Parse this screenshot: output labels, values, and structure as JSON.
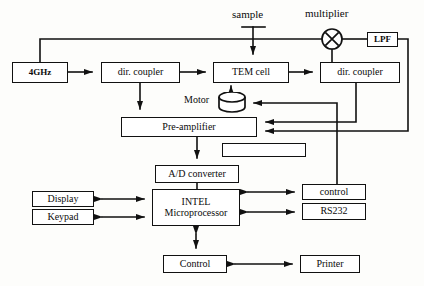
{
  "diagram": {
    "canvas": {
      "width": 424,
      "height": 286,
      "background": "#fdfdfb"
    },
    "stroke_color": "#111111",
    "text_color": "#0b0b0b",
    "nodes": [
      {
        "id": "source",
        "label": "4GHz",
        "x": 12,
        "y": 62,
        "w": 56,
        "h": 21,
        "font": 9,
        "shape": "rect"
      },
      {
        "id": "dir_coupler_1",
        "label": "dir. coupler",
        "x": 101,
        "y": 62,
        "w": 79,
        "h": 21,
        "font": 10,
        "shape": "rect"
      },
      {
        "id": "tem_cell",
        "label": "TEM cell",
        "x": 213,
        "y": 62,
        "w": 76,
        "h": 21,
        "font": 10,
        "shape": "rect"
      },
      {
        "id": "dir_coupler_2",
        "label": "dir. coupler",
        "x": 320,
        "y": 62,
        "w": 80,
        "h": 21,
        "font": 10,
        "shape": "rect"
      },
      {
        "id": "lpf",
        "label": "LPF",
        "x": 367,
        "y": 32,
        "w": 31,
        "h": 15,
        "font": 9,
        "shape": "rect"
      },
      {
        "id": "preamplifier",
        "label": "Pre-amplifier",
        "x": 121,
        "y": 117,
        "w": 136,
        "h": 20,
        "font": 10,
        "shape": "rect"
      },
      {
        "id": "blank_box",
        "label": "",
        "x": 222,
        "y": 143,
        "w": 84,
        "h": 14,
        "font": 9,
        "shape": "rect"
      },
      {
        "id": "ad_converter",
        "label": "A/D converter",
        "x": 155,
        "y": 165,
        "w": 84,
        "h": 18,
        "font": 10,
        "shape": "rect"
      },
      {
        "id": "display",
        "label": "Display",
        "x": 32,
        "y": 191,
        "w": 62,
        "h": 16,
        "font": 10,
        "shape": "rect"
      },
      {
        "id": "keypad",
        "label": "Keypad",
        "x": 32,
        "y": 209,
        "w": 62,
        "h": 16,
        "font": 10,
        "shape": "rect"
      },
      {
        "id": "microprocessor",
        "label": "INTEL\nMicroprocessor",
        "x": 152,
        "y": 189,
        "w": 88,
        "h": 37,
        "font": 10,
        "shape": "rect"
      },
      {
        "id": "control_right",
        "label": "control",
        "x": 302,
        "y": 184,
        "w": 64,
        "h": 16,
        "font": 10,
        "shape": "rect"
      },
      {
        "id": "rs232",
        "label": "RS232",
        "x": 302,
        "y": 203,
        "w": 64,
        "h": 17,
        "font": 10,
        "shape": "rect"
      },
      {
        "id": "control_bottom",
        "label": "Control",
        "x": 163,
        "y": 255,
        "w": 64,
        "h": 18,
        "font": 10,
        "shape": "rect"
      },
      {
        "id": "printer",
        "label": "Printer",
        "x": 300,
        "y": 255,
        "w": 60,
        "h": 18,
        "font": 10,
        "shape": "rect"
      }
    ],
    "free_labels": [
      {
        "id": "sample_label",
        "text": "sample",
        "x": 232,
        "y": 8,
        "font": 11
      },
      {
        "id": "multiplier_label",
        "text": "multiplier",
        "x": 305,
        "y": 7,
        "font": 11
      },
      {
        "id": "motor_label",
        "text": "Motor",
        "x": 184,
        "y": 94,
        "font": 10
      }
    ],
    "symbols": [
      {
        "id": "multiplier",
        "type": "circle-x",
        "cx": 332,
        "cy": 39,
        "r": 10
      },
      {
        "id": "motor",
        "type": "cylinder",
        "x": 218,
        "y": 94,
        "w": 28,
        "h": 17
      }
    ],
    "connections": [
      {
        "id": "source-to-coupler1",
        "from": "source",
        "to": "dir_coupler_1",
        "arrow": "single"
      },
      {
        "id": "coupler1-to-tem",
        "from": "dir_coupler_1",
        "to": "tem_cell",
        "arrow": "single"
      },
      {
        "id": "tem-to-coupler2",
        "from": "tem_cell",
        "to": "dir_coupler_2",
        "arrow": "single"
      },
      {
        "id": "sample-to-tem",
        "from": "sample_label",
        "to": "tem_cell",
        "arrow": "single"
      },
      {
        "id": "source-to-multiplier",
        "from": "source",
        "to": "multiplier",
        "arrow": "none"
      },
      {
        "id": "coupler2-to-multiplier",
        "from": "dir_coupler_2",
        "to": "multiplier",
        "arrow": "none"
      },
      {
        "id": "multiplier-to-lpf",
        "from": "multiplier",
        "to": "lpf",
        "arrow": "none"
      },
      {
        "id": "lpf-to-preamplifier",
        "from": "lpf",
        "to": "preamplifier",
        "arrow": "single"
      },
      {
        "id": "coupler2-to-preamplifier",
        "from": "dir_coupler_2",
        "to": "preamplifier",
        "arrow": "single"
      },
      {
        "id": "coupler1-to-preamplifier",
        "from": "dir_coupler_1",
        "to": "preamplifier",
        "arrow": "single"
      },
      {
        "id": "control-to-motor",
        "from": "control_right",
        "to": "motor",
        "arrow": "single"
      },
      {
        "id": "motor-to-tem",
        "from": "motor",
        "to": "tem_cell",
        "arrow": "single"
      },
      {
        "id": "preamplifier-to-ad",
        "from": "preamplifier",
        "to": "ad_converter",
        "arrow": "single"
      },
      {
        "id": "ad-to-microprocessor",
        "from": "ad_converter",
        "to": "microprocessor",
        "arrow": "none"
      },
      {
        "id": "display-microprocessor",
        "from": "display",
        "to": "microprocessor",
        "arrow": "double"
      },
      {
        "id": "keypad-microprocessor",
        "from": "keypad",
        "to": "microprocessor",
        "arrow": "double"
      },
      {
        "id": "microprocessor-control",
        "from": "microprocessor",
        "to": "control_right",
        "arrow": "double"
      },
      {
        "id": "microprocessor-rs232",
        "from": "microprocessor",
        "to": "rs232",
        "arrow": "double"
      },
      {
        "id": "microprocessor-bottom",
        "from": "microprocessor",
        "to": "control_bottom",
        "arrow": "double"
      },
      {
        "id": "control-printer",
        "from": "control_bottom",
        "to": "printer",
        "arrow": "double"
      }
    ]
  }
}
